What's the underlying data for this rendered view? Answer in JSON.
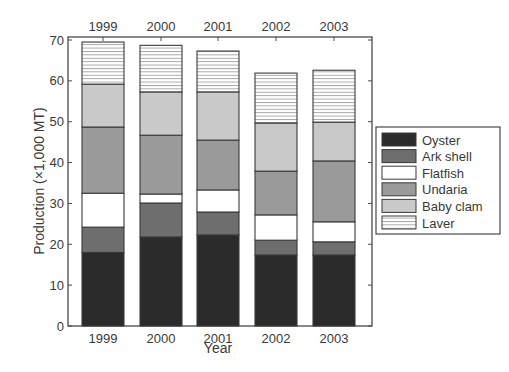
{
  "chart_data": {
    "type": "bar",
    "stacked": true,
    "title": "",
    "xlabel": "Year",
    "ylabel": "Production (×1,000 MT)",
    "ylim": [
      0,
      70
    ],
    "yticks": [
      0,
      10,
      20,
      30,
      40,
      50,
      60,
      70
    ],
    "categories": [
      "1999",
      "2000",
      "2001",
      "2002",
      "2003"
    ],
    "top_tick_labels": [
      "1999",
      "2000",
      "2001",
      "2002",
      "2003"
    ],
    "grid": false,
    "legend_position": "right",
    "series": [
      {
        "name": "Oyster",
        "color": "#2b2b2b",
        "pattern": "solid",
        "values": [
          18.0,
          21.8,
          22.3,
          17.4,
          17.4
        ]
      },
      {
        "name": "Ark shell",
        "color": "#6e6e6e",
        "pattern": "solid",
        "values": [
          6.2,
          8.3,
          5.6,
          3.6,
          3.2
        ]
      },
      {
        "name": "Flatfish",
        "color": "#ffffff",
        "pattern": "solid",
        "values": [
          8.3,
          2.2,
          5.4,
          6.2,
          4.9
        ]
      },
      {
        "name": "Undaria",
        "color": "#9a9a9a",
        "pattern": "solid",
        "values": [
          16.2,
          14.4,
          12.2,
          10.7,
          14.9
        ]
      },
      {
        "name": "Baby clam",
        "color": "#c9c9c9",
        "pattern": "solid",
        "values": [
          10.5,
          10.6,
          11.8,
          11.8,
          9.5
        ]
      },
      {
        "name": "Laver",
        "color": "#ffffff",
        "pattern": "horizontal-lines",
        "values": [
          10.3,
          11.4,
          10.0,
          12.2,
          12.7
        ]
      }
    ]
  },
  "labels": {
    "ylabel": "Production (×1,000 MT)",
    "xlabel": "Year"
  }
}
